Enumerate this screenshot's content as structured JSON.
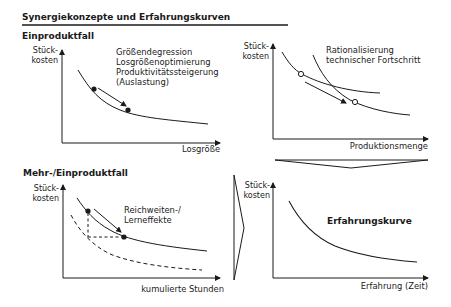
{
  "title": "Synergiekonzepte und Erfahrungskurven",
  "sections": {
    "top": "Einproduktfall",
    "bottom": "Mehr-/Einproduktfall"
  },
  "panels": {
    "top_left": {
      "y_label_line1": "Stück-",
      "y_label_line2": "kosten",
      "x_label": "Losgröße",
      "annotations": [
        "Größendegression",
        "Losgrößenoptimierung",
        "Produktivitätssteigerung",
        "(Auslastung)"
      ]
    },
    "top_right": {
      "y_label_line1": "Stück-",
      "y_label_line2": "kosten",
      "x_label": "Produktionsmenge",
      "annotations": [
        "Rationalisierung",
        "technischer Fortschritt"
      ]
    },
    "bottom_left": {
      "y_label_line1": "Stück-",
      "y_label_line2": "kosten",
      "x_label": "kumulierte Stunden",
      "annotations": [
        "Reichweiten-/",
        "Lerneffekte"
      ]
    },
    "bottom_right": {
      "y_label_line1": "Stück-",
      "y_label_line2": "kosten",
      "x_label": "Erfahrung (Zeit)",
      "curve_label": "Erfahrungskurve"
    }
  },
  "colors": {
    "line": "#1a1a1a",
    "background": "#ffffff"
  }
}
